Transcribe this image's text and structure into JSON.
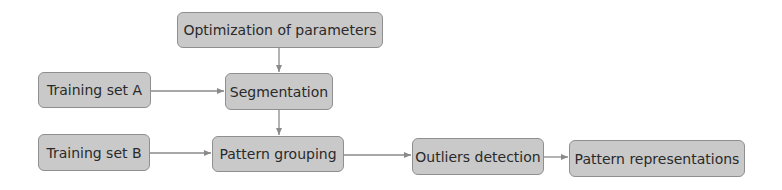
{
  "diagram": {
    "type": "flowchart",
    "nodes": [
      {
        "id": "optimization",
        "label": "Optimization of parameters",
        "x": 177,
        "y": 12,
        "w": 206,
        "h": 36
      },
      {
        "id": "training_a",
        "label": "Training set A",
        "x": 38,
        "y": 72,
        "w": 113,
        "h": 36
      },
      {
        "id": "segmentation",
        "label": "Segmentation",
        "x": 225,
        "y": 73,
        "w": 108,
        "h": 37
      },
      {
        "id": "training_b",
        "label": "Training set B",
        "x": 38,
        "y": 134,
        "w": 112,
        "h": 37
      },
      {
        "id": "pattern_grouping",
        "label": "Pattern grouping",
        "x": 212,
        "y": 136,
        "w": 132,
        "h": 36
      },
      {
        "id": "outliers",
        "label": "Outliers detection",
        "x": 412,
        "y": 138,
        "w": 132,
        "h": 37
      },
      {
        "id": "pattern_repr",
        "label": "Pattern representations",
        "x": 569,
        "y": 140,
        "w": 176,
        "h": 37
      }
    ],
    "edges": [
      {
        "from": "optimization",
        "to": "segmentation"
      },
      {
        "from": "training_a",
        "to": "segmentation"
      },
      {
        "from": "segmentation",
        "to": "pattern_grouping"
      },
      {
        "from": "training_b",
        "to": "pattern_grouping"
      },
      {
        "from": "pattern_grouping",
        "to": "outliers"
      },
      {
        "from": "outliers",
        "to": "pattern_repr"
      }
    ],
    "colors": {
      "node_fill": "#c9c9c9",
      "node_border": "#8f8f8f",
      "edge": "#8a8a8a",
      "text": "#2a2a2a"
    }
  }
}
